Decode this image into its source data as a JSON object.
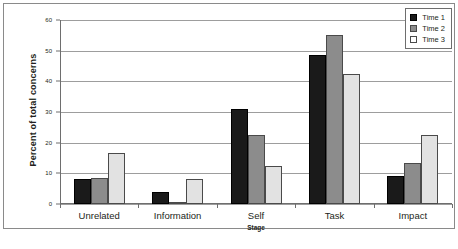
{
  "chart_data": {
    "type": "bar",
    "title": "",
    "xlabel": "Stage",
    "ylabel": "Percent of total concerns",
    "categories": [
      "Unrelated",
      "Information",
      "Self",
      "Task",
      "Impact"
    ],
    "series": [
      {
        "name": "Time 1",
        "color": "#1a1a1a",
        "values": [
          8,
          4,
          31,
          48.5,
          9
        ]
      },
      {
        "name": "Time 2",
        "color": "#8c8c8c",
        "values": [
          8.5,
          0.5,
          22.5,
          55,
          13.5
        ]
      },
      {
        "name": "Time 3",
        "color": "#e2e2e2",
        "values": [
          16.5,
          8,
          12.5,
          42.5,
          22.5
        ]
      }
    ],
    "ylim": [
      0,
      60
    ],
    "yticks": [
      0,
      10,
      20,
      30,
      40,
      50,
      60
    ],
    "ytick_labels": [
      "0",
      "10",
      "20",
      "30",
      "40",
      "50",
      "60"
    ],
    "grid": true,
    "legend_position": "top-right"
  },
  "legend": {
    "items": [
      {
        "label": "Time 1"
      },
      {
        "label": "Time 2"
      },
      {
        "label": "Time 3"
      }
    ]
  }
}
